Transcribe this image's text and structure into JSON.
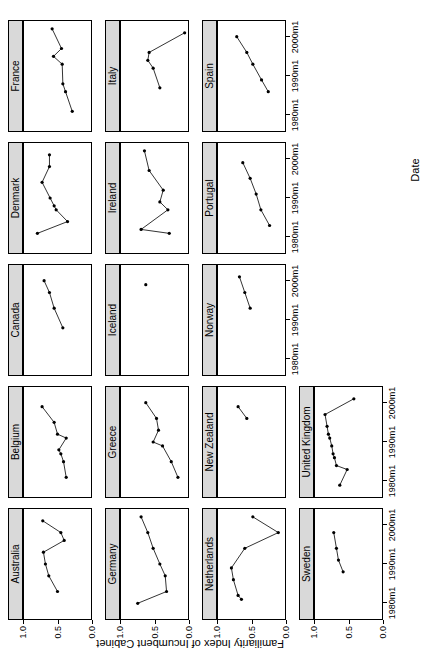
{
  "figure": {
    "rotation_note": "90-degree-counterclockwise",
    "xlabel": "Date",
    "ylabel": "Familiarity Index of Incumbent Cabinet",
    "x_ticks": [
      "1980m1",
      "1990m1",
      "2000m1"
    ],
    "y_ticks": [
      "0.0",
      "0.5",
      "1.0"
    ],
    "strip_bg": "#d9d9d9",
    "point_color": "#000000",
    "line_color": "#000000",
    "panel_border": "#000000"
  },
  "chart_data": {
    "type": "line",
    "title": "",
    "subtitle": "",
    "xlabel": "Date",
    "ylabel": "Familiarity Index of Incumbent Cabinet",
    "xlim": [
      1976,
      2004
    ],
    "ylim": [
      0.0,
      1.0
    ],
    "x_tick_labels": [
      "1980m1",
      "1990m1",
      "2000m1"
    ],
    "x_tick_values": [
      1980,
      1990,
      2000
    ],
    "y_tick_labels": [
      "0.0",
      "0.5",
      "1.0"
    ],
    "y_tick_values": [
      0.0,
      0.5,
      1.0
    ],
    "grid": false,
    "legend": "none",
    "marker": "filled-circle",
    "layout": {
      "rows": 4,
      "cols": 5
    },
    "panels": [
      {
        "name": "Australia",
        "row": 1,
        "col": 1,
        "x": [
          1983,
          1987,
          1990,
          1993,
          1996,
          1998,
          2001
        ],
        "y": [
          0.5,
          0.63,
          0.68,
          0.71,
          0.4,
          0.45,
          0.72
        ]
      },
      {
        "name": "Belgium",
        "row": 1,
        "col": 2,
        "x": [
          1981,
          1985,
          1987,
          1988,
          1991,
          1992,
          1995,
          1999
        ],
        "y": [
          0.37,
          0.41,
          0.45,
          0.48,
          0.37,
          0.5,
          0.55,
          0.73
        ]
      },
      {
        "name": "Canada",
        "row": 1,
        "col": 3,
        "x": [
          1988,
          1993,
          1997,
          2000
        ],
        "y": [
          0.42,
          0.55,
          0.62,
          0.7
        ]
      },
      {
        "name": "Denmark",
        "row": 1,
        "col": 4,
        "x": [
          1981,
          1984,
          1987,
          1988,
          1990,
          1994,
          1998,
          2001
        ],
        "y": [
          0.8,
          0.35,
          0.52,
          0.55,
          0.61,
          0.73,
          0.62,
          0.62
        ]
      },
      {
        "name": "France",
        "row": 1,
        "col": 5,
        "x": [
          1981,
          1986,
          1988,
          1993,
          1995,
          1997,
          2002
        ],
        "y": [
          0.28,
          0.38,
          0.42,
          0.43,
          0.56,
          0.44,
          0.58
        ]
      },
      {
        "name": "Germany",
        "row": 2,
        "col": 1,
        "x": [
          1980,
          1983,
          1987,
          1990,
          1994,
          1998,
          2002
        ],
        "y": [
          0.75,
          0.32,
          0.34,
          0.42,
          0.52,
          0.6,
          0.7
        ]
      },
      {
        "name": "Greece",
        "row": 2,
        "col": 2,
        "x": [
          1981,
          1985,
          1989,
          1990,
          1993,
          1996,
          2000
        ],
        "y": [
          0.15,
          0.25,
          0.38,
          0.52,
          0.44,
          0.47,
          0.63
        ]
      },
      {
        "name": "Iceland",
        "row": 2,
        "col": 3,
        "x": [
          1999
        ],
        "y": [
          0.63
        ]
      },
      {
        "name": "Ireland",
        "row": 2,
        "col": 4,
        "x": [
          1981,
          1982,
          1987,
          1989,
          1992,
          1997,
          2002
        ],
        "y": [
          0.28,
          0.7,
          0.3,
          0.42,
          0.37,
          0.58,
          0.65
        ]
      },
      {
        "name": "Italy",
        "row": 2,
        "col": 5,
        "x": [
          1987,
          1992,
          1994,
          1996,
          2001
        ],
        "y": [
          0.42,
          0.52,
          0.6,
          0.58,
          0.05
        ]
      },
      {
        "name": "Netherlands",
        "row": 3,
        "col": 1,
        "x": [
          1981,
          1982,
          1986,
          1989,
          1994,
          1998,
          2002
        ],
        "y": [
          0.65,
          0.7,
          0.77,
          0.8,
          0.6,
          0.1,
          0.48
        ]
      },
      {
        "name": "New Zealand",
        "row": 3,
        "col": 2,
        "x": [
          1996,
          1999
        ],
        "y": [
          0.57,
          0.7
        ]
      },
      {
        "name": "Norway",
        "row": 3,
        "col": 3,
        "x": [
          1993,
          1997,
          2001
        ],
        "y": [
          0.52,
          0.6,
          0.68
        ]
      },
      {
        "name": "Portugal",
        "row": 3,
        "col": 4,
        "x": [
          1983,
          1987,
          1991,
          1995,
          1999
        ],
        "y": [
          0.23,
          0.36,
          0.43,
          0.52,
          0.63
        ]
      },
      {
        "name": "Spain",
        "row": 3,
        "col": 5,
        "x": [
          1986,
          1989,
          1993,
          1996,
          2000
        ],
        "y": [
          0.25,
          0.35,
          0.48,
          0.57,
          0.72
        ]
      },
      {
        "name": "Sweden",
        "row": 4,
        "col": 1,
        "x": [
          1988,
          1991,
          1994,
          1998
        ],
        "y": [
          0.58,
          0.65,
          0.68,
          0.72
        ]
      },
      {
        "name": "United Kingdom",
        "row": 4,
        "col": 2,
        "x": [
          1979,
          1983,
          1984,
          1986,
          1987,
          1989,
          1991,
          1992,
          1994,
          1997,
          2001
        ],
        "y": [
          0.63,
          0.52,
          0.68,
          0.71,
          0.73,
          0.75,
          0.78,
          0.8,
          0.82,
          0.85,
          0.42
        ]
      }
    ]
  }
}
